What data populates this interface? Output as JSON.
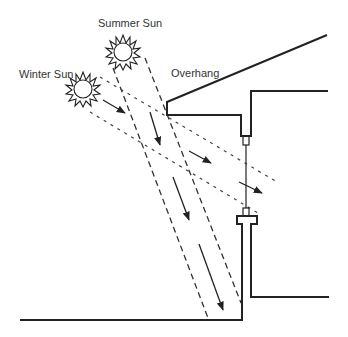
{
  "labels": {
    "summer_sun": "Summer Sun",
    "winter_sun": "Winter Sun",
    "overhang": "Overhang"
  },
  "colors": {
    "stroke": "#222222",
    "text": "#333333",
    "background": "#ffffff"
  },
  "elements": {
    "summer_sun": {
      "icon": "sun-icon",
      "center": [
        123,
        52
      ]
    },
    "winter_sun": {
      "icon": "sun-icon",
      "center": [
        83,
        89
      ]
    },
    "summer_rays": "two dashed steep rays with three downward arrows",
    "winter_rays": "two dotted shallow rays with three arrows",
    "building": "roof with overhang, wall, window with sill"
  }
}
